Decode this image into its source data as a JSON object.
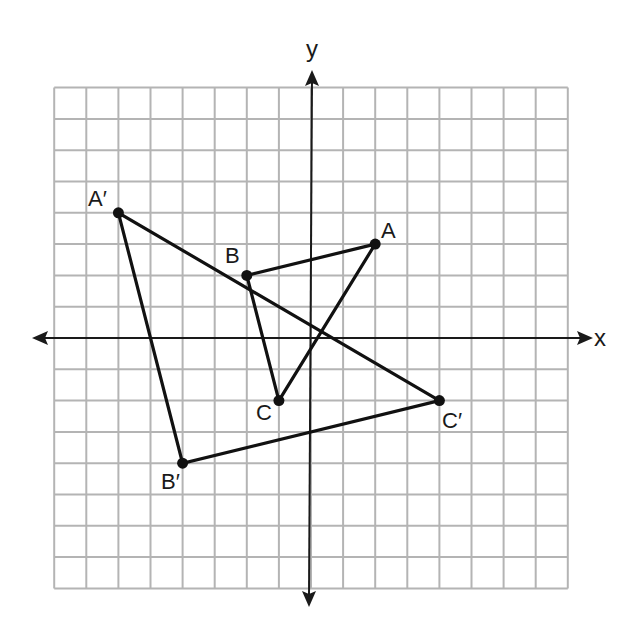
{
  "figure": {
    "type": "coordinate-plane",
    "axes": {
      "x_label": "x",
      "y_label": "y",
      "x_range": [
        -8,
        8
      ],
      "y_range": [
        -8,
        8
      ],
      "grid_step": 1
    },
    "colors": {
      "grid": "#b4b4b4",
      "axes": "#1a1a1a",
      "shapes": "#111111"
    },
    "triangles": [
      {
        "name": "ABC",
        "vertices": [
          {
            "label": "A",
            "x": 2,
            "y": 3
          },
          {
            "label": "B",
            "x": -2,
            "y": 2
          },
          {
            "label": "C",
            "x": -1,
            "y": -2
          }
        ]
      },
      {
        "name": "A'B'C'",
        "vertices": [
          {
            "label": "A′",
            "x": -6,
            "y": 4
          },
          {
            "label": "B′",
            "x": -4,
            "y": -4
          },
          {
            "label": "C′",
            "x": 4,
            "y": -2
          }
        ]
      }
    ]
  }
}
